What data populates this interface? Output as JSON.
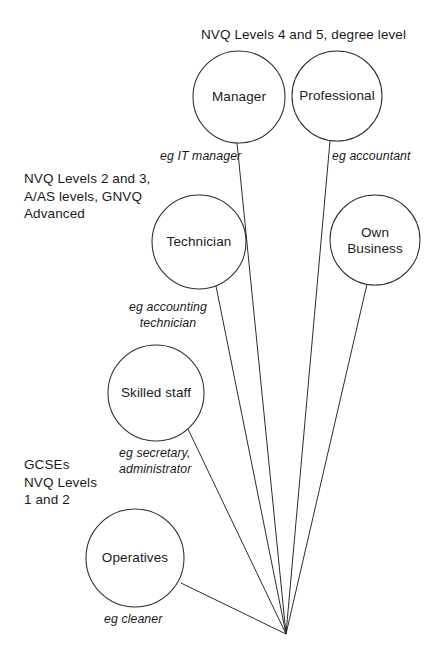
{
  "diagram": {
    "background_color": "#ffffff",
    "line_color": "#2b2b2b",
    "text_color": "#1a1a1a",
    "convergence_point": {
      "x": 286,
      "y": 634
    },
    "tier_labels": [
      {
        "id": "tier-higher",
        "text": "NVQ Levels 4 and 5, degree level",
        "x": 201,
        "y": 26,
        "align": "left"
      },
      {
        "id": "tier-intermediate",
        "text": "NVQ Levels 2 and 3,\nA/AS levels, GNVQ\nAdvanced",
        "x": 24,
        "y": 170,
        "align": "left"
      },
      {
        "id": "tier-foundation",
        "text": "GCSEs\nNVQ Levels\n1 and 2",
        "x": 24,
        "y": 456,
        "align": "left"
      }
    ],
    "nodes": [
      {
        "id": "manager",
        "label": "Manager",
        "cx": 239,
        "cy": 97,
        "r": 46
      },
      {
        "id": "professional",
        "label": "Professional",
        "cx": 337,
        "cy": 96,
        "r": 45
      },
      {
        "id": "technician",
        "label": "Technician",
        "cx": 199,
        "cy": 242,
        "r": 47
      },
      {
        "id": "own-business",
        "label": "Own\nBusiness",
        "cx": 375,
        "cy": 240,
        "r": 45
      },
      {
        "id": "skilled-staff",
        "label": "Skilled staff",
        "cx": 156,
        "cy": 393,
        "r": 48
      },
      {
        "id": "operatives",
        "label": "Operatives",
        "cx": 135,
        "cy": 558,
        "r": 49
      }
    ],
    "connectors": [
      {
        "id": "connector-manager",
        "from_node": "manager",
        "x1": 237,
        "y1": 143,
        "x2": 286,
        "y2": 634
      },
      {
        "id": "connector-professional",
        "from_node": "professional",
        "x1": 330,
        "y1": 141,
        "x2": 286,
        "y2": 634
      },
      {
        "id": "connector-technician",
        "from_node": "technician",
        "x1": 216,
        "y1": 286,
        "x2": 286,
        "y2": 634
      },
      {
        "id": "connector-own-business",
        "from_node": "own-business",
        "x1": 367,
        "y1": 284,
        "x2": 286,
        "y2": 634
      },
      {
        "id": "connector-skilled",
        "from_node": "skilled-staff",
        "x1": 188,
        "y1": 429,
        "x2": 286,
        "y2": 634
      },
      {
        "id": "connector-operatives",
        "from_node": "operatives",
        "x1": 181,
        "y1": 583,
        "x2": 286,
        "y2": 634
      }
    ],
    "examples": [
      {
        "id": "eg-it-manager",
        "text": "eg IT manager",
        "x": 160,
        "y": 148,
        "align": "left"
      },
      {
        "id": "eg-accountant",
        "text": "eg accountant",
        "x": 332,
        "y": 148,
        "align": "left"
      },
      {
        "id": "eg-accounting",
        "text": "eg accounting\ntechnician",
        "x": 168,
        "y": 299,
        "align": "center"
      },
      {
        "id": "eg-secretary",
        "text": "eg secretary,\nadministrator",
        "x": 119,
        "y": 445,
        "align": "left"
      },
      {
        "id": "eg-cleaner",
        "text": "eg cleaner",
        "x": 104,
        "y": 611,
        "align": "left"
      }
    ]
  }
}
